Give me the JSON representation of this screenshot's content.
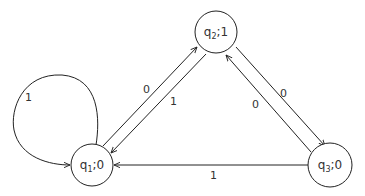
{
  "diagram": {
    "type": "state-machine",
    "states": [
      {
        "id": "q1",
        "name": "q",
        "sub": "1",
        "output": "0",
        "sep": ";"
      },
      {
        "id": "q2",
        "name": "q",
        "sub": "2",
        "output": "1",
        "sep": ";"
      },
      {
        "id": "q3",
        "name": "q",
        "sub": "3",
        "output": "0",
        "sep": ";"
      }
    ],
    "transitions": [
      {
        "from": "q1",
        "to": "q1",
        "input": "1"
      },
      {
        "from": "q1",
        "to": "q2",
        "input": "0"
      },
      {
        "from": "q2",
        "to": "q1",
        "input": "1"
      },
      {
        "from": "q2",
        "to": "q3",
        "input": "0"
      },
      {
        "from": "q3",
        "to": "q2",
        "input": "0"
      },
      {
        "from": "q3",
        "to": "q1",
        "input": "1"
      }
    ],
    "colors": {
      "stroke": "#222222",
      "text": "#333333",
      "background": "#ffffff"
    }
  }
}
